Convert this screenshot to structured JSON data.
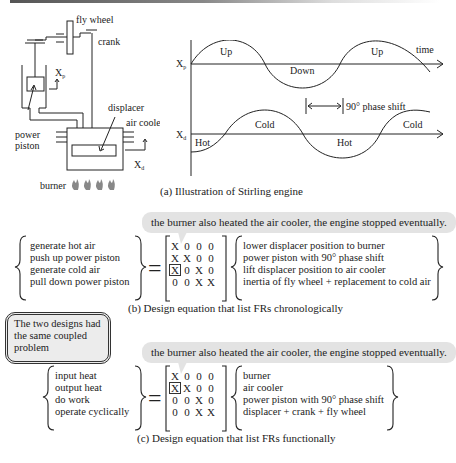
{
  "figure": {
    "engine_diagram": {
      "labels": {
        "fly_wheel": "fly wheel",
        "crank": "crank",
        "xp": "X",
        "xp_sub": "p",
        "power_piston_1": "power",
        "power_piston_2": "piston",
        "displacer": "displacer",
        "air_cooler": "air cooler",
        "xd": "X",
        "xd_sub": "d",
        "burner": "burner"
      },
      "flame_icon": "🔥",
      "flame_count": 4
    },
    "waveform": {
      "xp_label": "X",
      "xp_sub": "p",
      "xd_label": "X",
      "xd_sub": "d",
      "time_label": "time",
      "xp_regions": [
        "Up",
        "Down",
        "Up"
      ],
      "xd_regions": [
        "Hot",
        "Cold",
        "Hot",
        "Cold"
      ],
      "phase_shift_label": "90° phase shift"
    },
    "caption_a": "(a) Illustration of  Stirling engine",
    "callout_b": "the burner also heated the air cooler, the engine stopped eventually.",
    "equation_b": {
      "frs": [
        "generate hot air",
        "push up power piston",
        "generate cold air",
        "pull down power piston"
      ],
      "matrix": [
        [
          "X",
          "0",
          "0",
          "0"
        ],
        [
          "X",
          "X",
          "0",
          "0"
        ],
        [
          "X",
          "0",
          "X",
          "0"
        ],
        [
          "0",
          "0",
          "X",
          "X"
        ]
      ],
      "boxed_cell": [
        2,
        0
      ],
      "dps": [
        "lower displacer position to burner",
        "power piston with 90° phase shift",
        "lift displacer position to air cooler",
        "inertia of fly wheel + replacement to cold air"
      ],
      "equals": "="
    },
    "caption_b": "(b) Design equation that list FRs chronologically",
    "note": "The two designs had the same coupled problem",
    "callout_c": "the burner also heated the air cooler, the engine stopped eventually.",
    "equation_c": {
      "frs": [
        "input heat",
        "output heat",
        "do work",
        "operate cyclically"
      ],
      "matrix": [
        [
          "X",
          "0",
          "0",
          "0"
        ],
        [
          "X",
          "X",
          "0",
          "0"
        ],
        [
          "0",
          "0",
          "X",
          "0"
        ],
        [
          "0",
          "0",
          "X",
          "X"
        ]
      ],
      "boxed_cell": [
        1,
        0
      ],
      "dps": [
        "burner",
        "air cooler",
        "power piston with 90° phase shift",
        "displacer + crank + fly wheel"
      ],
      "equals": "="
    },
    "caption_c": "(c) Design equation that list FRs functionally"
  }
}
